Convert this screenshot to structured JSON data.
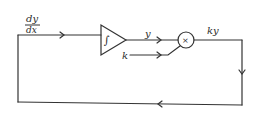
{
  "diagram": {
    "type": "block-diagram",
    "title": "",
    "labels": {
      "input_numerator": "dy",
      "input_denominator": "dx",
      "integrator_symbol": "∫",
      "integrator_output": "y",
      "constant_input": "k",
      "multiplier_symbol": "×",
      "multiplier_output": "ky"
    },
    "nodes": [
      {
        "id": "integrator",
        "shape": "triangle",
        "label": "∫"
      },
      {
        "id": "multiplier",
        "shape": "circle",
        "label": "×"
      }
    ],
    "edges": [
      {
        "from": "feedback",
        "to": "integrator",
        "label": "dy/dx"
      },
      {
        "from": "integrator",
        "to": "multiplier",
        "label": "y"
      },
      {
        "from": "constant",
        "to": "multiplier",
        "label": "k"
      },
      {
        "from": "multiplier",
        "to": "feedback",
        "label": "ky"
      }
    ],
    "colors": {
      "stroke": "#333333",
      "background": "#ffffff"
    }
  }
}
